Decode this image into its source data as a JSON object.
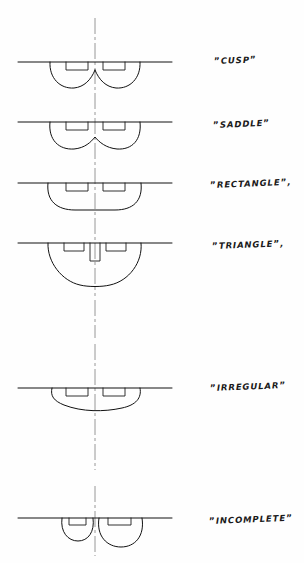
{
  "document": {
    "type": "technical-line-drawing",
    "medium": "white-paper",
    "ink_color": "#111111",
    "centerline_color": "#8c8c8c",
    "centerline_style": "dash-dot",
    "centerline_x": 95,
    "baseline_left_x": 18,
    "baseline_right_x": 172
  },
  "figures": [
    {
      "id": "cusp",
      "label": "CUSP",
      "open_quote": "”",
      "close_quote": "”",
      "trailing_punctuation": "",
      "baseline_y": 62,
      "label_x": 214,
      "label_y": 62,
      "profile": "double-lobe-with-central-cusp",
      "notches": 2,
      "depth": 26,
      "description": "two rounded lobes meeting at a sharp central cusp below the reference line"
    },
    {
      "id": "saddle",
      "label": "SADDLE",
      "open_quote": "”",
      "close_quote": "”",
      "trailing_punctuation": "",
      "baseline_y": 122,
      "label_x": 213,
      "label_y": 126,
      "profile": "double-lobe-with-shallow-central-dip",
      "notches": 2,
      "depth": 27,
      "description": "broad lobes joined by a smooth shallow saddle dip at the centre"
    },
    {
      "id": "rectangle",
      "label": "RECTANGLE",
      "open_quote": "”",
      "close_quote": "”",
      "trailing_punctuation": ",",
      "baseline_y": 183,
      "label_x": 210,
      "label_y": 186,
      "profile": "broad-flat-bottomed-arc",
      "notches": 2,
      "depth": 27,
      "description": "single wide arc with a flattened bottom and no central dip"
    },
    {
      "id": "triangle",
      "label": "TRIANGLE",
      "open_quote": "”",
      "close_quote": "”",
      "trailing_punctuation": ",",
      "baseline_y": 243,
      "label_x": 212,
      "label_y": 248,
      "profile": "deep-vee-arc-with-central-notch",
      "notches": 3,
      "depth": 42,
      "description": "deep rounded vee reaching the lowest point, with an extra narrow notch on the centreline"
    },
    {
      "id": "irregular",
      "label": "IRREGULAR",
      "open_quote": "”",
      "close_quote": "”",
      "trailing_punctuation": "",
      "baseline_y": 388,
      "label_x": 210,
      "label_y": 390,
      "profile": "asymmetric-arc",
      "notches": 2,
      "depth": 24,
      "description": "unbalanced outline, shallow at the left and running deeper toward the right"
    },
    {
      "id": "incomplete",
      "label": "INCOMPLETE",
      "open_quote": "”",
      "close_quote": "”",
      "trailing_punctuation": "",
      "baseline_y": 518,
      "label_x": 209,
      "label_y": 524,
      "profile": "two-separate-lobes",
      "notches": 2,
      "depth": 24,
      "description": "two detached lobes, a smaller one left of centre and a larger one right of centre, not joined"
    }
  ]
}
